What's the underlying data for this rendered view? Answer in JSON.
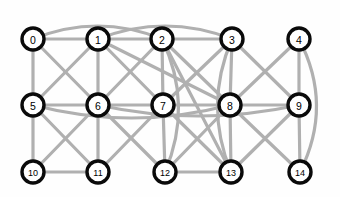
{
  "figure": {
    "type": "graph-diagram",
    "title": "",
    "background_color": "#ffffff",
    "node_fill": "#ffffff",
    "node_stroke": "#0a0a0a",
    "edge_color": "#b0b0b0",
    "node_radius": 11,
    "edge_width": 3.2
  },
  "graph": {
    "node_count": 15,
    "edge_count": 41,
    "layout": "3-row grid, 5 columns",
    "nodes": [
      {
        "id": "0",
        "label": "0",
        "x": 33,
        "y": 39
      },
      {
        "id": "1",
        "label": "1",
        "x": 98,
        "y": 39
      },
      {
        "id": "2",
        "label": "2",
        "x": 162,
        "y": 39
      },
      {
        "id": "3",
        "label": "3",
        "x": 232,
        "y": 39
      },
      {
        "id": "4",
        "label": "4",
        "x": 299,
        "y": 39
      },
      {
        "id": "5",
        "label": "5",
        "x": 33,
        "y": 105
      },
      {
        "id": "6",
        "label": "6",
        "x": 98,
        "y": 105
      },
      {
        "id": "7",
        "label": "7",
        "x": 163,
        "y": 105
      },
      {
        "id": "8",
        "label": "8",
        "x": 230,
        "y": 105
      },
      {
        "id": "9",
        "label": "9",
        "x": 299,
        "y": 105
      },
      {
        "id": "10",
        "label": "10",
        "x": 33,
        "y": 172
      },
      {
        "id": "11",
        "label": "11",
        "x": 98,
        "y": 172
      },
      {
        "id": "12",
        "label": "12",
        "x": 165,
        "y": 172
      },
      {
        "id": "13",
        "label": "13",
        "x": 231,
        "y": 172
      },
      {
        "id": "14",
        "label": "14",
        "x": 300,
        "y": 172
      }
    ],
    "edges": [
      {
        "source": "0",
        "target": "1",
        "curve": 0
      },
      {
        "source": "1",
        "target": "2",
        "curve": 0
      },
      {
        "source": "2",
        "target": "3",
        "curve": 0
      },
      {
        "source": "0",
        "target": "2",
        "curve": -26
      },
      {
        "source": "1",
        "target": "3",
        "curve": -26
      },
      {
        "source": "0",
        "target": "5",
        "curve": 0
      },
      {
        "source": "0",
        "target": "6",
        "curve": 0
      },
      {
        "source": "1",
        "target": "5",
        "curve": 0
      },
      {
        "source": "1",
        "target": "6",
        "curve": 0
      },
      {
        "source": "1",
        "target": "7",
        "curve": 0
      },
      {
        "source": "1",
        "target": "8",
        "curve": 0
      },
      {
        "source": "2",
        "target": "6",
        "curve": 0
      },
      {
        "source": "2",
        "target": "7",
        "curve": 0
      },
      {
        "source": "2",
        "target": "8",
        "curve": 0
      },
      {
        "source": "2",
        "target": "12",
        "curve": -30
      },
      {
        "source": "2",
        "target": "13",
        "curve": 0
      },
      {
        "source": "3",
        "target": "7",
        "curve": 0
      },
      {
        "source": "3",
        "target": "8",
        "curve": 0
      },
      {
        "source": "3",
        "target": "9",
        "curve": 0
      },
      {
        "source": "3",
        "target": "13",
        "curve": 28
      },
      {
        "source": "4",
        "target": "8",
        "curve": 0
      },
      {
        "source": "4",
        "target": "9",
        "curve": 0
      },
      {
        "source": "4",
        "target": "14",
        "curve": -34
      },
      {
        "source": "5",
        "target": "6",
        "curve": 0
      },
      {
        "source": "6",
        "target": "7",
        "curve": 0
      },
      {
        "source": "7",
        "target": "8",
        "curve": 0
      },
      {
        "source": "8",
        "target": "9",
        "curve": 0
      },
      {
        "source": "5",
        "target": "8",
        "curve": 26
      },
      {
        "source": "6",
        "target": "9",
        "curve": 22
      },
      {
        "source": "5",
        "target": "10",
        "curve": 0
      },
      {
        "source": "5",
        "target": "11",
        "curve": 0
      },
      {
        "source": "6",
        "target": "10",
        "curve": 0
      },
      {
        "source": "6",
        "target": "11",
        "curve": 0
      },
      {
        "source": "6",
        "target": "12",
        "curve": 0
      },
      {
        "source": "7",
        "target": "11",
        "curve": 0
      },
      {
        "source": "7",
        "target": "12",
        "curve": 0
      },
      {
        "source": "7",
        "target": "13",
        "curve": 0
      },
      {
        "source": "8",
        "target": "12",
        "curve": 0
      },
      {
        "source": "8",
        "target": "13",
        "curve": 0
      },
      {
        "source": "8",
        "target": "14",
        "curve": 0
      },
      {
        "source": "9",
        "target": "13",
        "curve": 0
      },
      {
        "source": "9",
        "target": "14",
        "curve": 0
      },
      {
        "source": "10",
        "target": "11",
        "curve": 0
      },
      {
        "source": "12",
        "target": "13",
        "curve": 0
      }
    ]
  }
}
